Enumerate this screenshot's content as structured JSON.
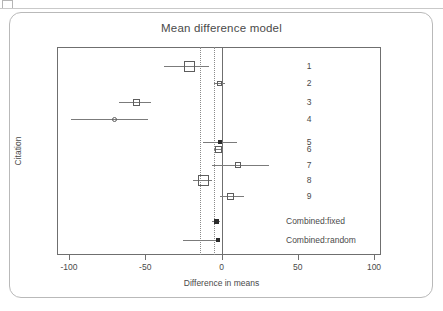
{
  "chart_data": {
    "type": "scatter",
    "plot_kind": "forest-plot",
    "title": "Mean difference model",
    "xlabel": "Difference in means",
    "ylabel": "Citation",
    "xlim": [
      -113,
      105
    ],
    "xticks": [
      -100,
      -50,
      0,
      50,
      100
    ],
    "xtick_labels": [
      "-100",
      "-50",
      "0",
      "50",
      "100"
    ],
    "grid": false,
    "legend": "none",
    "zero_line": 0,
    "reference_lines": [
      -14,
      -5
    ],
    "categories": [
      "1",
      "2",
      "3",
      "4",
      "5",
      "6",
      "7",
      "8",
      "9",
      "Combined:fixed",
      "Combined:random"
    ],
    "rows": [
      {
        "label": "1",
        "estimate": -21,
        "ci_low": -38,
        "ci_high": -8,
        "marker": "open-square",
        "marker_size": 11,
        "summary": false
      },
      {
        "label": "2",
        "estimate": -1,
        "ci_low": -5,
        "ci_high": 2,
        "marker": "open-square",
        "marker_size": 5,
        "summary": false
      },
      {
        "label": "3",
        "estimate": -56,
        "ci_low": -67,
        "ci_high": -46,
        "marker": "open-square",
        "marker_size": 7,
        "summary": false
      },
      {
        "label": "4",
        "estimate": -70,
        "ci_low": -99,
        "ci_high": -48,
        "marker": "open-circle",
        "marker_size": 5,
        "summary": false
      },
      {
        "label": "5",
        "estimate": -1,
        "ci_low": -12,
        "ci_high": 10,
        "marker": "filled-square",
        "marker_size": 4,
        "summary": false
      },
      {
        "label": "6",
        "estimate": -2,
        "ci_low": -5,
        "ci_high": 1,
        "marker": "open-square",
        "marker_size": 7,
        "summary": false
      },
      {
        "label": "7",
        "estimate": 11,
        "ci_low": -6,
        "ci_high": 31,
        "marker": "open-square",
        "marker_size": 6,
        "summary": false
      },
      {
        "label": "8",
        "estimate": -12,
        "ci_low": -19,
        "ci_high": -6,
        "marker": "open-square",
        "marker_size": 11,
        "summary": false
      },
      {
        "label": "9",
        "estimate": 6,
        "ci_low": -1,
        "ci_high": 15,
        "marker": "open-square",
        "marker_size": 7,
        "summary": false
      },
      {
        "label": "Combined:fixed",
        "estimate": -3,
        "ci_low": -6,
        "ci_high": -1,
        "marker": "filled-square",
        "marker_size": 5,
        "summary": true
      },
      {
        "label": "Combined:random",
        "estimate": -2,
        "ci_low": -25,
        "ci_high": -1,
        "marker": "filled-square",
        "marker_size": 4,
        "summary": true
      }
    ]
  },
  "axis": {
    "x_title": "Difference in means",
    "y_title": "Citation"
  },
  "title": "Mean difference model"
}
